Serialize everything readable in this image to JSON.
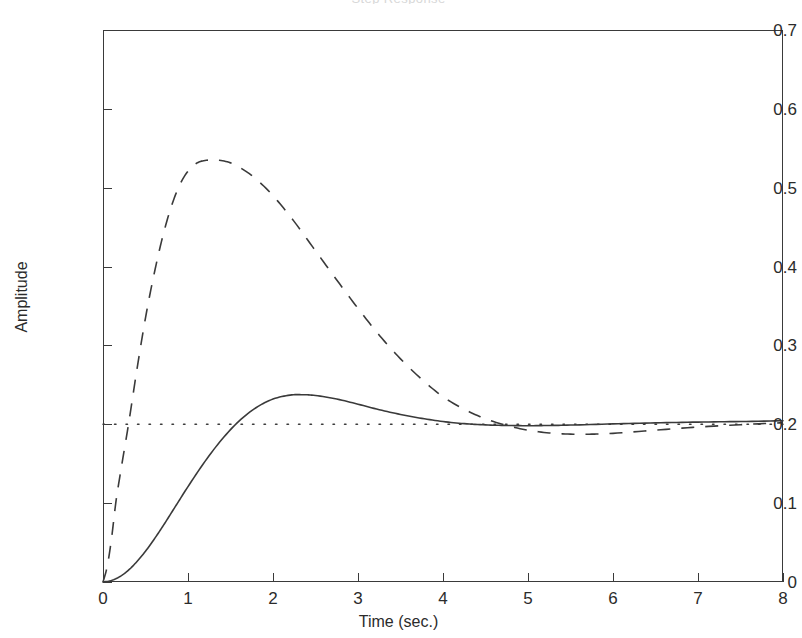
{
  "figure": {
    "title": "Step Response",
    "xlabel": "Time (sec.)",
    "ylabel": "Amplitude"
  },
  "axes": {
    "x_ticks": [
      "0",
      "1",
      "2",
      "3",
      "4",
      "5",
      "6",
      "7",
      "8"
    ],
    "y_ticks": [
      "0",
      "0.1",
      "0.2",
      "0.3",
      "0.4",
      "0.5",
      "0.6",
      "0.7"
    ]
  },
  "colors": {
    "axis": "#3a3a3a",
    "curve": "#3a3a3a",
    "background": "#ffffff"
  },
  "chart_data": {
    "type": "line",
    "title": "Step Response",
    "xlabel": "Time (sec.)",
    "ylabel": "Amplitude",
    "xlim": [
      0,
      8
    ],
    "ylim": [
      0,
      0.7
    ],
    "xticks": [
      0,
      1,
      2,
      3,
      4,
      5,
      6,
      7,
      8
    ],
    "yticks": [
      0,
      0.1,
      0.2,
      0.3,
      0.4,
      0.5,
      0.6,
      0.7
    ],
    "grid": false,
    "legend": null,
    "series": [
      {
        "name": "Slower response (solid)",
        "style": "solid",
        "color": "#3a3a3a",
        "peak_value": 0.237,
        "peak_time": 2.35,
        "steady_state": 0.205,
        "x": [
          0,
          0.1,
          0.2,
          0.3,
          0.4,
          0.5,
          0.6,
          0.7,
          0.8,
          0.9,
          1.0,
          1.2,
          1.4,
          1.6,
          1.8,
          2.0,
          2.2,
          2.35,
          2.5,
          2.75,
          3.0,
          3.25,
          3.5,
          3.75,
          4.0,
          4.25,
          4.5,
          4.75,
          5.0,
          5.25,
          5.5,
          6.0,
          6.5,
          7.0,
          7.5,
          8.0
        ],
        "y": [
          0.0,
          0.002,
          0.007,
          0.015,
          0.026,
          0.039,
          0.054,
          0.07,
          0.087,
          0.104,
          0.121,
          0.153,
          0.181,
          0.204,
          0.221,
          0.232,
          0.237,
          0.2375,
          0.2365,
          0.232,
          0.2255,
          0.2185,
          0.2125,
          0.2075,
          0.2035,
          0.2008,
          0.1992,
          0.1985,
          0.1982,
          0.1985,
          0.199,
          0.2005,
          0.2018,
          0.2028,
          0.2035,
          0.2045
        ]
      },
      {
        "name": "Faster response with overshoot (dashed)",
        "style": "dashed",
        "color": "#3a3a3a",
        "peak_value": 0.535,
        "peak_time": 1.35,
        "steady_state": 0.205,
        "x": [
          0,
          0.05,
          0.1,
          0.15,
          0.2,
          0.3,
          0.4,
          0.5,
          0.6,
          0.7,
          0.8,
          0.9,
          1.0,
          1.1,
          1.2,
          1.35,
          1.5,
          1.65,
          1.8,
          2.0,
          2.25,
          2.5,
          2.75,
          3.0,
          3.25,
          3.5,
          3.75,
          4.0,
          4.25,
          4.5,
          4.75,
          5.0,
          5.25,
          5.5,
          5.75,
          6.0,
          6.5,
          7.0,
          7.5,
          8.0
        ],
        "y": [
          0.0,
          0.02,
          0.055,
          0.1,
          0.135,
          0.2,
          0.27,
          0.335,
          0.39,
          0.437,
          0.475,
          0.503,
          0.521,
          0.531,
          0.5345,
          0.535,
          0.5315,
          0.523,
          0.511,
          0.49,
          0.457,
          0.42,
          0.383,
          0.347,
          0.313,
          0.283,
          0.257,
          0.235,
          0.219,
          0.207,
          0.1985,
          0.1925,
          0.189,
          0.1875,
          0.1875,
          0.1885,
          0.1925,
          0.1965,
          0.1995,
          0.202
        ]
      },
      {
        "name": "Reference / final value (dotted)",
        "style": "dotted",
        "color": "#3a3a3a",
        "value": 0.2,
        "x": [
          0,
          8
        ],
        "y": [
          0.2,
          0.2
        ]
      }
    ]
  }
}
